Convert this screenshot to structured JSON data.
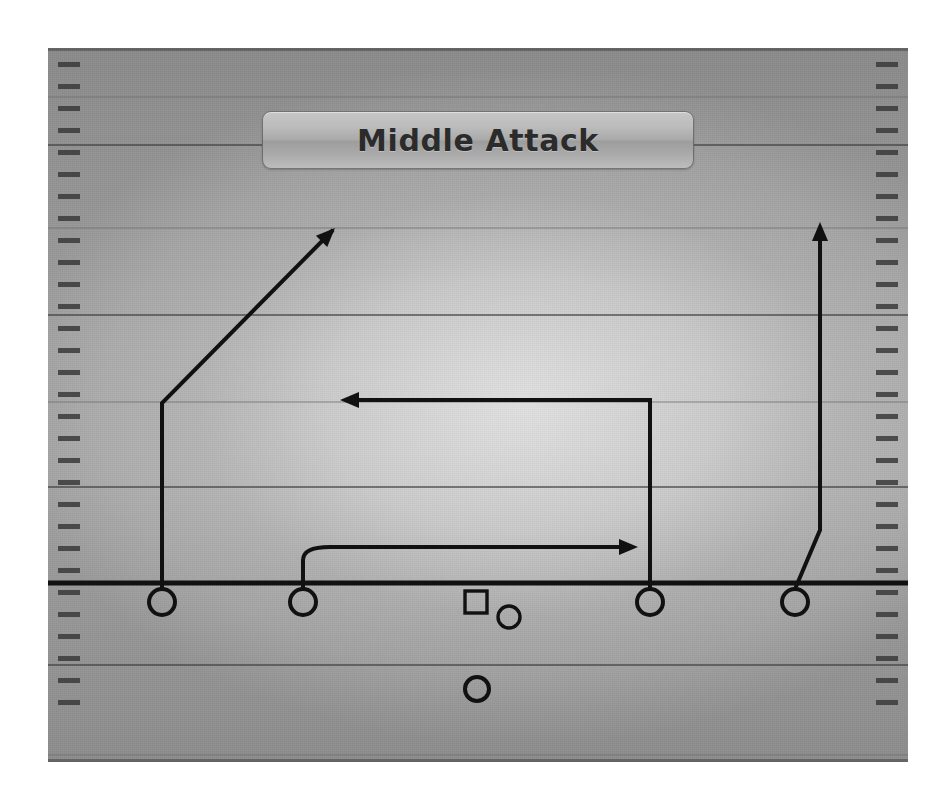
{
  "title": {
    "text": "Middle Attack"
  },
  "field": {
    "label": "volleyball-court-diagram",
    "background_color": "#ababab",
    "line_color": "#555555",
    "ink_color": "#111111",
    "bounds": {
      "x": 48,
      "y": 48,
      "width": 860,
      "height": 714
    },
    "yard_lines_y": [
      97,
      145,
      228,
      315,
      402,
      487,
      583,
      665,
      755
    ],
    "scrimmage_line_y": 583,
    "tick_spacing": 22,
    "tick_count_per_side": 30
  },
  "players": [
    {
      "id": "p1",
      "name": "outside-hitter-left",
      "shape": "circle",
      "x": 162,
      "y": 602,
      "r": 13
    },
    {
      "id": "p2",
      "name": "setter-front-left",
      "shape": "circle",
      "x": 303,
      "y": 602,
      "r": 13
    },
    {
      "id": "p3",
      "name": "middle-blocker-box",
      "shape": "square",
      "x": 476,
      "y": 602,
      "size": 22
    },
    {
      "id": "p4",
      "name": "libero-small",
      "shape": "circle",
      "x": 509,
      "y": 617,
      "r": 11
    },
    {
      "id": "p5",
      "name": "opposite-hitter",
      "shape": "circle",
      "x": 650,
      "y": 602,
      "r": 13
    },
    {
      "id": "p6",
      "name": "right-side-hitter",
      "shape": "circle",
      "x": 795,
      "y": 602,
      "r": 13
    },
    {
      "id": "p7",
      "name": "back-row-defender",
      "shape": "circle",
      "x": 477,
      "y": 689,
      "r": 12
    }
  ],
  "routes": [
    {
      "id": "r1",
      "name": "left-outside-diagonal-route",
      "from_player": "p1",
      "description": "Straight up from left hitter, then diagonal up-right",
      "points": [
        [
          162,
          589
        ],
        [
          162,
          403
        ],
        [
          333,
          230
        ]
      ],
      "arrow": {
        "x": 335,
        "y": 228,
        "direction": "up-right",
        "angle": -45
      }
    },
    {
      "id": "r2",
      "name": "opposite-hitter-deep-cross-route",
      "from_player": "p5",
      "description": "Straight up from opposite hitter, then cut left across",
      "points": [
        [
          650,
          589
        ],
        [
          650,
          400
        ],
        [
          348,
          400
        ]
      ],
      "arrow": {
        "x": 340,
        "y": 400,
        "direction": "left",
        "angle": 180
      }
    },
    {
      "id": "r3",
      "name": "setter-curl-route",
      "from_player": "p2",
      "description": "Curl up from setter then run right",
      "points": [
        [
          303,
          589
        ],
        [
          303,
          560
        ],
        [
          330,
          547
        ],
        [
          628,
          547
        ]
      ],
      "arrow": {
        "x": 638,
        "y": 547,
        "direction": "right",
        "angle": 0
      }
    },
    {
      "id": "r4",
      "name": "right-side-vertical-route",
      "from_player": "p6",
      "description": "Angle out from right hitter, then straight up the sideline",
      "points": [
        [
          795,
          589
        ],
        [
          820,
          530
        ],
        [
          820,
          235
        ]
      ],
      "arrow": {
        "x": 820,
        "y": 222,
        "direction": "up",
        "angle": -90
      }
    }
  ],
  "scrimmage": {
    "name": "line-of-scrimmage",
    "x1": 48,
    "x2": 908,
    "y": 583
  }
}
